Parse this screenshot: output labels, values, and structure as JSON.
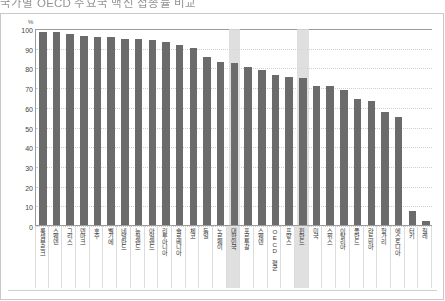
{
  "title": "국가별 OECD 주요국 백신 접종률 비교",
  "axis": {
    "unit": "%",
    "y_ticks": [
      100,
      90,
      80,
      70,
      60,
      50,
      40,
      30,
      20,
      10,
      0
    ],
    "ymin": 0,
    "ymax": 100
  },
  "chart_data": {
    "type": "bar",
    "title": "국가별 OECD 주요국 백신 접종률 비교",
    "xlabel": "",
    "ylabel": "%",
    "ylim": [
      0,
      100
    ],
    "grid": true,
    "legend": "none",
    "bar_color": "#6b6b6b",
    "highlight_color": "#d9d9d9",
    "highlighted_indices": [
      14,
      19
    ],
    "categories": [
      "룩셈부르크",
      "스웨덴",
      "그리스",
      "덴마크",
      "호주",
      "벨기에",
      "네덜란드",
      "뉴질랜드",
      "아일랜드",
      "리투아니아",
      "슬로베니아",
      "체코",
      "독일",
      "노르웨이",
      "대한민국",
      "포르투갈",
      "스웨덴",
      "OECD 평균",
      "프랑스",
      "핀란드",
      "미국",
      "스위스",
      "이탈리아",
      "폴란드",
      "라트비아",
      "헝가리",
      "에스토니아",
      "터키",
      "칠레"
    ],
    "values": [
      98.0,
      98.0,
      97.0,
      96.0,
      95.5,
      95.5,
      94.5,
      94.5,
      94.0,
      93.0,
      91.5,
      90.0,
      85.5,
      83.0,
      82.0,
      80.0,
      78.5,
      76.0,
      75.0,
      74.5,
      70.5,
      70.5,
      68.5,
      64.0,
      63.0,
      57.5,
      55.0,
      7.0,
      2.0
    ]
  }
}
